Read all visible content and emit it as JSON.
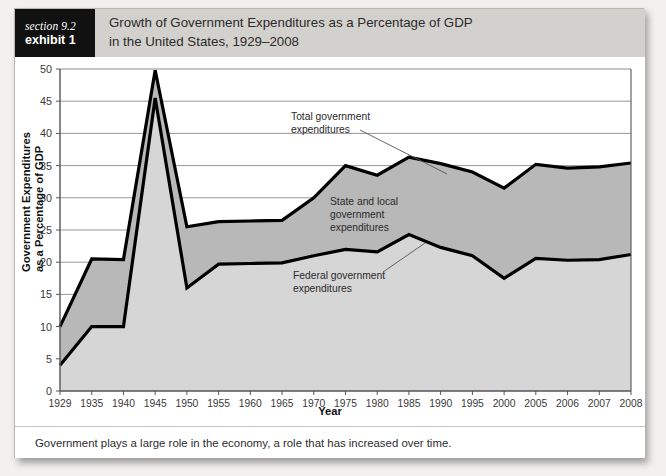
{
  "header": {
    "tag_section": "section 9.2",
    "tag_exhibit": "exhibit 1",
    "title_line1": "Growth of Government Expenditures as a Percentage of GDP",
    "title_line2": "in the United States, 1929–2008"
  },
  "caption": {
    "text": "Government plays a large role in the economy, a role that has increased over time."
  },
  "colors": {
    "header_band": "#d3d1cd",
    "tag_background": "#111111",
    "line": "#000000",
    "state_local_fill": "#b8b8b8",
    "federal_fill": "#d6d6d6",
    "grid": "#8b8b8b",
    "page_background": "#f2f1ef",
    "card_background": "#ffffff"
  },
  "chart_data": {
    "type": "area",
    "title": "Growth of Government Expenditures as a Percentage of GDP in the United States, 1929–2008",
    "xlabel": "Year",
    "ylabel": "Government Expenditures as a Percentage of GDP",
    "ylim": [
      0,
      50
    ],
    "ytick_labels": [
      "0",
      "5",
      "10",
      "15",
      "20",
      "25",
      "30",
      "35",
      "40",
      "45",
      "50"
    ],
    "yticks": [
      0,
      5,
      10,
      15,
      20,
      25,
      30,
      35,
      40,
      45,
      50
    ],
    "grid": true,
    "legend": "none",
    "categories": [
      "1929",
      "1935",
      "1940",
      "1945",
      "1950",
      "1955",
      "1960",
      "1965",
      "1970",
      "1975",
      "1980",
      "1985",
      "1990",
      "1995",
      "2000",
      "2005",
      "2006",
      "2007",
      "2008"
    ],
    "series": [
      {
        "name": "Total government expenditures",
        "values": [
          10.0,
          20.5,
          20.4,
          49.8,
          25.5,
          26.3,
          26.4,
          26.5,
          30.0,
          35.0,
          33.5,
          36.3,
          35.3,
          34.0,
          31.5,
          35.2,
          34.6,
          34.8,
          35.4
        ]
      },
      {
        "name": "Federal government expenditures",
        "values": [
          4.0,
          10.0,
          10.0,
          45.5,
          16.0,
          19.7,
          19.8,
          19.9,
          21.0,
          22.0,
          21.6,
          24.3,
          22.3,
          21.0,
          17.5,
          20.6,
          20.3,
          20.4,
          21.2
        ]
      }
    ],
    "annotations": [
      {
        "id": "total-government-expenditures",
        "label_line1": "Total government",
        "label_line2": "expenditures"
      },
      {
        "id": "state-and-local-government-expenditures",
        "label_line1": "State and local",
        "label_line2": "government",
        "label_line3": "expenditures"
      },
      {
        "id": "federal-government-expenditures",
        "label_line1": "Federal government",
        "label_line2": "expenditures"
      }
    ]
  }
}
